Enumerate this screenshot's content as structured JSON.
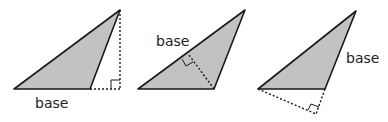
{
  "colors": {
    "fill": "#c2c2c2",
    "stroke": "#1a1a1a",
    "dotted": "#1a1a1a"
  },
  "triangles": [
    {
      "id": "triangle-1",
      "base_label": "base",
      "label_pos": [
        35,
        108
      ],
      "base_side": "bottom horizontal side",
      "height_style": "vertical dotted line outside triangle with right-angle marker at base extension"
    },
    {
      "id": "triangle-2",
      "base_label": "base",
      "label_pos": [
        156,
        46
      ],
      "base_side": "upper-left slanted side",
      "height_style": "dotted altitude from bottom-right vertex to the slanted side with right-angle marker"
    },
    {
      "id": "triangle-3",
      "base_label": "base",
      "label_pos": [
        346,
        63
      ],
      "base_side": "right slanted side",
      "height_style": "dotted altitude from left vertex to extension of right side with right-angle marker"
    }
  ]
}
